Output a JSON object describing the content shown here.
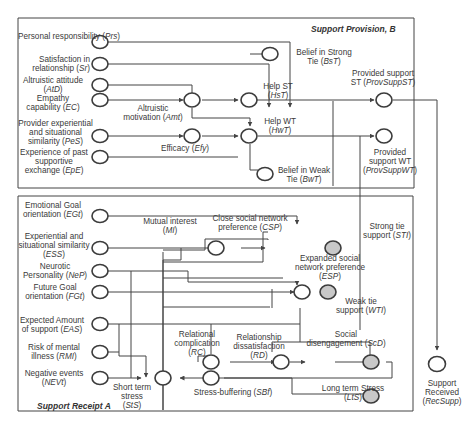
{
  "sections": {
    "provision": {
      "title": "Support Provision, B"
    },
    "receipt": {
      "title": "Support Receipt A"
    }
  },
  "nodes": {
    "prs": {
      "label": "Personal responsibility",
      "abbr": "Prs"
    },
    "sr": {
      "label": "Satisfaction in relationship",
      "abbr": "Sr"
    },
    "atd": {
      "label": "Altruistic attitude",
      "abbr": "AtD"
    },
    "ec": {
      "label": "Empathy capability",
      "abbr": "EC"
    },
    "pes": {
      "label": "Provider experiential and situational similarity",
      "abbr": "PeS"
    },
    "epe": {
      "label": "Experience of past supportive exchange",
      "abbr": "EpE"
    },
    "amt": {
      "label": "Altruistic motivation",
      "abbr": "Amt"
    },
    "efy": {
      "label": "Efficacy",
      "abbr": "Efy"
    },
    "bst": {
      "label": "Belief in Strong Tie",
      "abbr": "BsT"
    },
    "bwt": {
      "label": "Belief in Weak Tie",
      "abbr": "BwT"
    },
    "hst": {
      "label": "Help ST",
      "abbr": "HsT"
    },
    "hwt": {
      "label": "Help WT",
      "abbr": "HwT"
    },
    "provsuppst": {
      "label": "Provided support ST",
      "abbr": "ProvSuppST"
    },
    "provsuppwt": {
      "label": "Provided support WT",
      "abbr": "ProvSuppWT"
    },
    "egt": {
      "label": "Emotional Goal orientation",
      "abbr": "EGt"
    },
    "ess": {
      "label": "Experiential and situational similarity",
      "abbr": "ESS"
    },
    "nep": {
      "label": "Neurotic Personality",
      "abbr": "NeP"
    },
    "fgt": {
      "label": "Future Goal orientation",
      "abbr": "FGt"
    },
    "eas": {
      "label": "Expected Amount of support",
      "abbr": "EAS"
    },
    "rmi": {
      "label": "Risk of mental illness",
      "abbr": "RMI"
    },
    "nevt": {
      "label": "Negative events",
      "abbr": "NEVt"
    },
    "mi": {
      "label": "Mutual interest",
      "abbr": "MI"
    },
    "csp": {
      "label": "Close social network preference",
      "abbr": "CSP"
    },
    "esp": {
      "label": "Expanded social network preference",
      "abbr": "ESP"
    },
    "sti": {
      "label": "Strong tie support",
      "abbr": "STI"
    },
    "wti": {
      "label": "Weak tie support",
      "abbr": "WTI"
    },
    "rc": {
      "label": "Relational complication",
      "abbr": "RC"
    },
    "rd": {
      "label": "Relationship dissatisfaction",
      "abbr": "RD"
    },
    "scd": {
      "label": "Social disengagement",
      "abbr": "ScD"
    },
    "srs": {
      "label": "Short term stress",
      "abbr": "StS"
    },
    "sbf": {
      "label": "Stress-buffering",
      "abbr": "SBf"
    },
    "lts": {
      "label": "Long term Stress",
      "abbr": "LtS"
    },
    "recsupp": {
      "label": "Support Received",
      "abbr": "RecSupp"
    }
  },
  "colors": {
    "line": "#444444",
    "node_fill": "#ffffff",
    "output_fill": "#c8c8c8"
  }
}
